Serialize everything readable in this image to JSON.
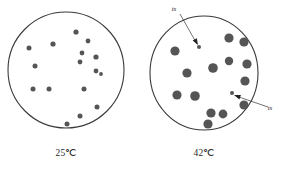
{
  "figure": {
    "caption_left": "25℃",
    "caption_right": "42℃",
    "colony_color": "#555555",
    "small_colony_color": "#555555",
    "dish_outline_color": "#3a3a3a",
    "background_color": "#ffffff",
    "label_color": "#2b2b2b"
  },
  "dishes": [
    {
      "id": "dish-25c",
      "label": "25℃",
      "label_x": 66,
      "label_y": 156,
      "center_x": 66,
      "center_y": 70,
      "radius_x": 58,
      "radius_y": 58,
      "colony_count": 16,
      "colonies": [
        {
          "cx": 76,
          "cy": 32,
          "r": 2.6
        },
        {
          "cx": 53,
          "cy": 44,
          "r": 2.6
        },
        {
          "cx": 88,
          "cy": 41,
          "r": 2.4
        },
        {
          "cx": 29,
          "cy": 48,
          "r": 2.5
        },
        {
          "cx": 82,
          "cy": 53,
          "r": 2.4
        },
        {
          "cx": 96,
          "cy": 57,
          "r": 2.6
        },
        {
          "cx": 35,
          "cy": 66,
          "r": 2.5
        },
        {
          "cx": 80,
          "cy": 62,
          "r": 2.4
        },
        {
          "cx": 96,
          "cy": 71,
          "r": 2.4
        },
        {
          "cx": 33,
          "cy": 89,
          "r": 2.5
        },
        {
          "cx": 49,
          "cy": 89,
          "r": 2.5
        },
        {
          "cx": 84,
          "cy": 89,
          "r": 2.5
        },
        {
          "cx": 97,
          "cy": 107,
          "r": 2.5
        },
        {
          "cx": 80,
          "cy": 116,
          "r": 2.5
        },
        {
          "cx": 67,
          "cy": 124,
          "r": 2.5
        },
        {
          "cx": 101,
          "cy": 74,
          "r": 1.9
        }
      ]
    },
    {
      "id": "dish-42c",
      "label": "42℃",
      "label_x": 204,
      "label_y": 156,
      "center_x": 204,
      "center_y": 73,
      "radius_x": 54,
      "radius_y": 57,
      "colony_count": 16,
      "colonies": [
        {
          "cx": 229,
          "cy": 38,
          "r": 4.6
        },
        {
          "cx": 244,
          "cy": 42,
          "r": 4.6
        },
        {
          "cx": 175,
          "cy": 51,
          "r": 4.6
        },
        {
          "cx": 229,
          "cy": 61,
          "r": 4.2
        },
        {
          "cx": 247,
          "cy": 64,
          "r": 4.6
        },
        {
          "cx": 213,
          "cy": 68,
          "r": 4.8
        },
        {
          "cx": 187,
          "cy": 73,
          "r": 4.6
        },
        {
          "cx": 245,
          "cy": 81,
          "r": 4.6
        },
        {
          "cx": 177,
          "cy": 95,
          "r": 4.6
        },
        {
          "cx": 195,
          "cy": 96,
          "r": 4.8
        },
        {
          "cx": 244,
          "cy": 105,
          "r": 4.6
        },
        {
          "cx": 211,
          "cy": 113,
          "r": 4.6
        },
        {
          "cx": 223,
          "cy": 114,
          "r": 4.4
        },
        {
          "cx": 208,
          "cy": 124,
          "r": 4.6
        }
      ],
      "small_colonies": [
        {
          "cx": 199,
          "cy": 47,
          "r": 2.0,
          "name": "ts-colony-upper"
        },
        {
          "cx": 232,
          "cy": 93,
          "r": 2.0,
          "name": "ts-colony-lower"
        }
      ]
    }
  ],
  "annotations": [
    {
      "id": "ts-annotation-upper",
      "text": "ts",
      "text_x": 174,
      "text_y": 11,
      "line_x1": 180,
      "line_y1": 14,
      "line_x2": 197,
      "line_y2": 44,
      "arrow_x": 198,
      "arrow_y": 45
    },
    {
      "id": "ts-annotation-lower",
      "text": "ts",
      "text_x": 270,
      "text_y": 110,
      "line_x1": 268,
      "line_y1": 107,
      "line_x2": 236,
      "line_y2": 96,
      "arrow_x": 234,
      "arrow_y": 95
    }
  ]
}
